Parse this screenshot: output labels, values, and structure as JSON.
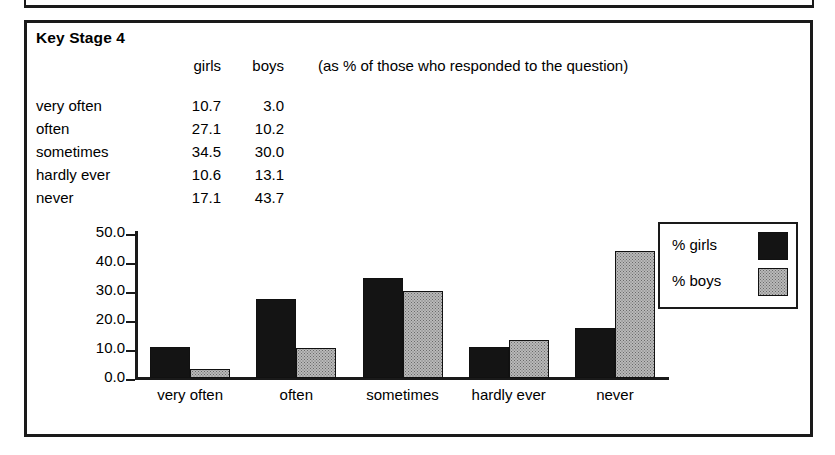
{
  "figure": {
    "title": "Key Stage 4",
    "note": "(as % of those who responded to the question)"
  },
  "table": {
    "header": {
      "blank": "",
      "girls": "girls",
      "boys": "boys"
    },
    "rows": [
      {
        "label": "very often",
        "girls": "10.7",
        "boys": "3.0"
      },
      {
        "label": "often",
        "girls": "27.1",
        "boys": "10.2"
      },
      {
        "label": "sometimes",
        "girls": "34.5",
        "boys": "30.0"
      },
      {
        "label": "hardly ever",
        "girls": "10.6",
        "boys": "13.1"
      },
      {
        "label": "never",
        "girls": "17.1",
        "boys": "43.7"
      }
    ]
  },
  "legend": {
    "items": [
      {
        "label": "% girls",
        "swatch": "black-solid"
      },
      {
        "label": "% boys",
        "swatch": "grey-dotted"
      }
    ]
  },
  "axis": {
    "yticks": [
      "50.0",
      "40.0",
      "30.0",
      "20.0",
      "10.0",
      "0.0"
    ]
  },
  "chart_data": {
    "type": "bar",
    "title": "Key Stage 4",
    "subtitle": "(as % of those who responded to the question)",
    "categories": [
      "very often",
      "often",
      "sometimes",
      "hardly ever",
      "never"
    ],
    "series": [
      {
        "name": "% girls",
        "values": [
          10.7,
          27.1,
          34.5,
          10.6,
          17.1
        ],
        "color": "#141414"
      },
      {
        "name": "% boys",
        "values": [
          3.0,
          10.2,
          30.0,
          13.1,
          43.7
        ],
        "color": "#b9b9b9"
      }
    ],
    "xlabel": "",
    "ylabel": "",
    "ylim": [
      0,
      50
    ],
    "ytick_step": 10,
    "ytick_labels": [
      "0.0",
      "10.0",
      "20.0",
      "30.0",
      "40.0",
      "50.0"
    ],
    "grid": false,
    "legend_position": "right"
  }
}
